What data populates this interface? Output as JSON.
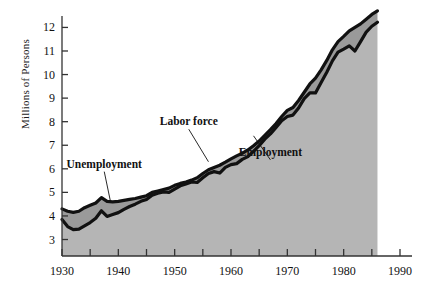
{
  "chart_data": {
    "type": "area",
    "title": "",
    "xlabel": "",
    "ylabel": "Millions of Persons",
    "xlim": [
      1930,
      1990
    ],
    "ylim": [
      2.3,
      12.4
    ],
    "grid": false,
    "legend_position": "inline-annotations",
    "x_ticks_major": [
      1930,
      1940,
      1950,
      1960,
      1970,
      1980,
      1990
    ],
    "x_ticks_minor": [
      1935,
      1945,
      1955,
      1965,
      1975,
      1985
    ],
    "y_ticks": [
      3,
      4,
      5,
      6,
      7,
      8,
      9,
      10,
      11,
      12
    ],
    "x_tick_labels": [
      "1930",
      "1940",
      "1950",
      "1960",
      "1970",
      "1980",
      "1990"
    ],
    "y_tick_labels": [
      "3",
      "4",
      "5",
      "6",
      "7",
      "8",
      "9",
      "10",
      "11",
      "12"
    ],
    "colors": {
      "line": "#111111",
      "employment_fill": "#b5b5b5",
      "unemployment_fill": "#9a9a9a",
      "axis": "#333333",
      "background": "#ffffff"
    },
    "annotations": [
      {
        "label": "Unemployment",
        "x": 1937.5,
        "y": 6.05
      },
      {
        "label": "Labor force",
        "x": 1952.5,
        "y": 7.85
      },
      {
        "label": "Employment",
        "x": 1967.0,
        "y": 6.55
      }
    ],
    "x": [
      1930,
      1931,
      1932,
      1933,
      1934,
      1935,
      1936,
      1937,
      1938,
      1939,
      1940,
      1941,
      1942,
      1943,
      1944,
      1945,
      1946,
      1947,
      1948,
      1949,
      1950,
      1951,
      1952,
      1953,
      1954,
      1955,
      1956,
      1957,
      1958,
      1959,
      1960,
      1961,
      1962,
      1963,
      1964,
      1965,
      1966,
      1967,
      1968,
      1969,
      1970,
      1971,
      1972,
      1973,
      1974,
      1975,
      1976,
      1977,
      1978,
      1979,
      1980,
      1981,
      1982,
      1983,
      1984,
      1985,
      1986
    ],
    "series": [
      {
        "name": "Labor force",
        "values": [
          4.3,
          4.2,
          4.15,
          4.2,
          4.35,
          4.45,
          4.55,
          4.78,
          4.62,
          4.6,
          4.62,
          4.66,
          4.7,
          4.74,
          4.8,
          4.86,
          5.0,
          5.06,
          5.12,
          5.18,
          5.3,
          5.38,
          5.44,
          5.52,
          5.62,
          5.8,
          5.96,
          6.06,
          6.15,
          6.28,
          6.42,
          6.55,
          6.66,
          6.8,
          6.98,
          7.18,
          7.42,
          7.66,
          7.92,
          8.22,
          8.48,
          8.6,
          8.9,
          9.25,
          9.6,
          9.85,
          10.2,
          10.6,
          11.05,
          11.4,
          11.62,
          11.85,
          12.0,
          12.15,
          12.35,
          12.55,
          12.7
        ]
      },
      {
        "name": "Employment",
        "values": [
          3.85,
          3.55,
          3.42,
          3.44,
          3.58,
          3.72,
          3.9,
          4.22,
          3.98,
          4.06,
          4.14,
          4.28,
          4.4,
          4.5,
          4.62,
          4.7,
          4.88,
          4.96,
          5.02,
          5.0,
          5.14,
          5.28,
          5.36,
          5.44,
          5.42,
          5.62,
          5.8,
          5.88,
          5.82,
          6.06,
          6.18,
          6.22,
          6.4,
          6.52,
          6.74,
          6.98,
          7.26,
          7.48,
          7.76,
          8.04,
          8.22,
          8.28,
          8.58,
          8.98,
          9.22,
          9.22,
          9.66,
          10.1,
          10.58,
          10.95,
          11.08,
          11.22,
          11.0,
          11.4,
          11.8,
          12.05,
          12.22
        ]
      }
    ]
  },
  "axis_title": {
    "y": "Millions of Persons"
  }
}
